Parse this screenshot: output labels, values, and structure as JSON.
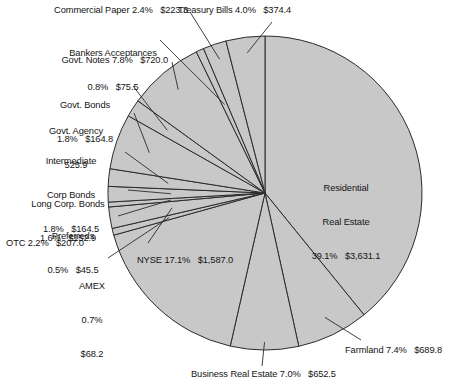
{
  "chart_data": {
    "type": "pie",
    "title": "",
    "subtitle": "",
    "xlabel": "",
    "ylabel": "",
    "units": "billions of dollars",
    "legend_position": "none",
    "grid": false,
    "start_angle_deg": 0,
    "direction": "clockwise",
    "total_value": 9284.9,
    "slice_fill_color": "#c8c8c8",
    "slice_stroke_color": "#2b2b2b",
    "categories": [
      "Residential Real Estate",
      "Farmland",
      "Business Real Estate",
      "NYSE",
      "AMEX",
      "OTC",
      "Preferreds",
      "Long Corp. Bonds",
      "Intermediate Corp Bonds",
      "Govt. Agency",
      "Govt. Bonds",
      "Govt. Notes",
      "Bankers Acceptances",
      "Commercial Paper",
      "Treasury Bills"
    ],
    "percents": [
      39.1,
      7.4,
      7.0,
      17.1,
      0.7,
      2.2,
      0.5,
      1.6,
      1.8,
      5.7,
      1.8,
      7.8,
      0.8,
      2.4,
      4.0
    ],
    "values": [
      3631.1,
      689.8,
      652.5,
      1587.0,
      68.2,
      207.0,
      45.5,
      152.9,
      164.5,
      525.9,
      164.8,
      720.0,
      75.5,
      223.3,
      374.4
    ]
  },
  "labels": {
    "commercial_paper": "Commercial Paper 2.4%   $223.3",
    "bankers_acceptances_l1": "Bankers Acceptances",
    "bankers_acceptances_l2": "0.8%   $75.5",
    "govt_notes": "Govt. Notes 7.8%   $720.0",
    "govt_bonds_l1": "Govt. Bonds",
    "govt_bonds_l2": "1.8%   $164.8",
    "govt_agency_l1": "Govt. Agency",
    "govt_agency_l2": "525.9",
    "intermediate_corp_bonds_l1": "Intermediate",
    "intermediate_corp_bonds_l2": "Corp Bonds",
    "intermediate_corp_bonds_l3": "1.8%   $164.5",
    "long_corp_bonds_l1": "Long Corp. Bonds",
    "long_corp_bonds_l2": "1.6%   $152.9",
    "preferreds_l1": "Preferreds",
    "preferreds_l2": "0.5%   $45.5",
    "otc": "OTC 2.2%   $207.0",
    "amex_l1": "AMEX",
    "amex_l2": "0.7%",
    "amex_l3": "$68.2",
    "treasury_bills": "Treasury Bills 4.0%   $374.4",
    "residential_l1": "Residential",
    "residential_l2": "Real Estate",
    "residential_l3": "39.1%   $3,631.1",
    "nyse": "NYSE 17.1%   $1,587.0",
    "farmland": "Farmland 7.4%   $689.8",
    "business_real_estate": "Business Real Estate 7.0%   $652.5"
  }
}
